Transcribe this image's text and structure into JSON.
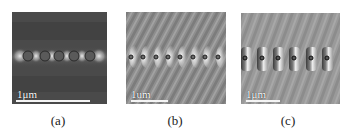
{
  "figure": {
    "panels": [
      {
        "id": "a",
        "caption": "(a)",
        "scale_label": "1μm",
        "background": "#4a4a4a",
        "rod_count": 5,
        "style": "dark field with bright glow between circular particles"
      },
      {
        "id": "b",
        "caption": "(b)",
        "scale_label": "1um",
        "background": "#8e8e8e",
        "rod_count": 8,
        "style": "gray field with diagonal wave fringes and bright arcs"
      },
      {
        "id": "c",
        "caption": "(c)",
        "scale_label": "1μm",
        "background": "#9a9a9a",
        "rod_count": 6,
        "style": "gray field with bright/dark bands around particles"
      }
    ]
  }
}
